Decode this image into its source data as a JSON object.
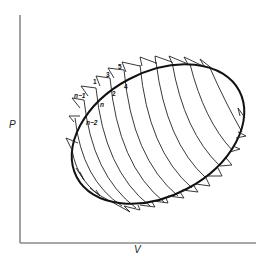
{
  "diagram": {
    "type": "pressure-volume cycle diagram",
    "axes": {
      "y_label": "P",
      "x_label": "V"
    },
    "cycle": {
      "shape": "closed elliptical cycle (bold) approximated by many small steps",
      "color": "#111111"
    },
    "curves": {
      "count": 11,
      "description": "family of curved lines crossing the cycle from upper-left to lower-right",
      "color": "#222222"
    },
    "step_labels": [
      {
        "id": "1",
        "text": "1"
      },
      {
        "id": "2",
        "text": "2"
      },
      {
        "id": "3",
        "text": "3"
      },
      {
        "id": "4",
        "text": "4"
      },
      {
        "id": "5",
        "text": "5"
      },
      {
        "id": "n-1",
        "text": "n−1"
      },
      {
        "id": "n",
        "text": "n"
      },
      {
        "id": "n-2",
        "text": "n−2"
      }
    ],
    "colors": {
      "axis": "#8a8a8a",
      "ink": "#111111",
      "background": "#ffffff"
    }
  }
}
